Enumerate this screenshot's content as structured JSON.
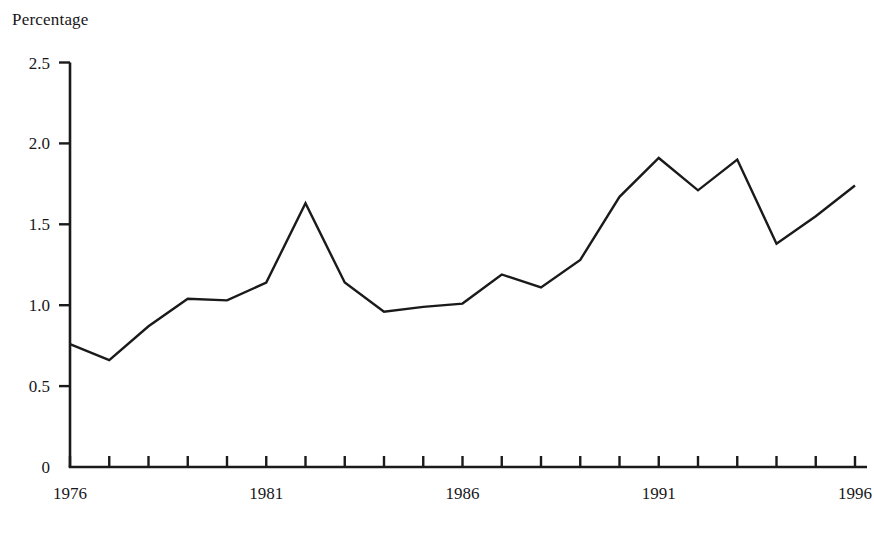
{
  "chart_data": {
    "type": "line",
    "title": "",
    "subtitle": "",
    "ylabel": "Percentage",
    "xlabel": "",
    "x": [
      1976,
      1977,
      1978,
      1979,
      1980,
      1981,
      1982,
      1983,
      1984,
      1985,
      1986,
      1987,
      1988,
      1989,
      1990,
      1991,
      1992,
      1993,
      1994,
      1995,
      1996
    ],
    "values": [
      0.76,
      0.66,
      0.87,
      1.04,
      1.03,
      1.14,
      1.63,
      1.14,
      0.96,
      0.99,
      1.01,
      1.19,
      1.11,
      1.28,
      1.67,
      1.91,
      1.71,
      1.9,
      1.38,
      1.55,
      1.74
    ],
    "series": [
      {
        "name": "Percentage",
        "values": [
          0.76,
          0.66,
          0.87,
          1.04,
          1.03,
          1.14,
          1.63,
          1.14,
          0.96,
          0.99,
          1.01,
          1.19,
          1.11,
          1.28,
          1.67,
          1.91,
          1.71,
          1.9,
          1.38,
          1.55,
          1.74
        ]
      }
    ],
    "xlim": [
      1976,
      1996
    ],
    "ylim": [
      0,
      2.5
    ],
    "ytick_labels": [
      "0",
      "0.5",
      "1.0",
      "1.5",
      "2.0",
      "2.5"
    ],
    "ytick_values": [
      0,
      0.5,
      1.0,
      1.5,
      2.0,
      2.5
    ],
    "xtick_values": [
      1976,
      1977,
      1978,
      1979,
      1980,
      1981,
      1982,
      1983,
      1984,
      1985,
      1986,
      1987,
      1988,
      1989,
      1990,
      1991,
      1992,
      1993,
      1994,
      1995,
      1996
    ],
    "xtick_labels_shown": [
      "1976",
      "1981",
      "1986",
      "1991",
      "1996"
    ],
    "xtick_labeled_values": [
      1976,
      1981,
      1986,
      1991,
      1996
    ],
    "grid": false,
    "legend": false,
    "legend_position": "none",
    "line_color": "#1a1a1a",
    "line_width": 2.4,
    "axis_color": "#1a1a1a"
  }
}
